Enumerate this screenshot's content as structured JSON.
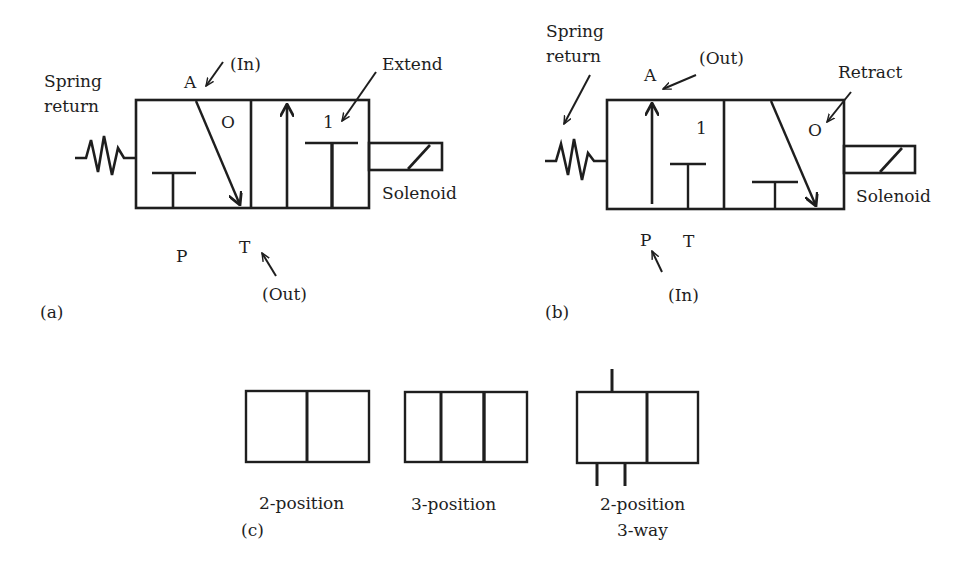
{
  "colors": {
    "ink": "#1e1e1e",
    "background": "#ffffff"
  },
  "panel_a": {
    "caption": "(a)",
    "spring_label_line1": "Spring",
    "spring_label_line2": "return",
    "port_a": "A",
    "port_a_flow": "(In)",
    "state_label": "Extend",
    "position_left": "O",
    "position_right": "1",
    "actuator_label": "Solenoid",
    "port_p": "P",
    "port_t": "T",
    "port_t_flow": "(Out)"
  },
  "panel_b": {
    "caption": "(b)",
    "spring_label_line1": "Spring",
    "spring_label_line2": "return",
    "port_a": "A",
    "port_a_flow": "(Out)",
    "state_label": "Retract",
    "position_left": "1",
    "position_right": "O",
    "actuator_label": "Solenoid",
    "port_p": "P",
    "port_p_flow": "(In)",
    "port_t": "T"
  },
  "panel_c": {
    "caption": "(c)",
    "symbols": [
      {
        "label_line1": "2-position",
        "label_line2": ""
      },
      {
        "label_line1": "3-position",
        "label_line2": ""
      },
      {
        "label_line1": "2-position",
        "label_line2": "3-way"
      }
    ]
  }
}
